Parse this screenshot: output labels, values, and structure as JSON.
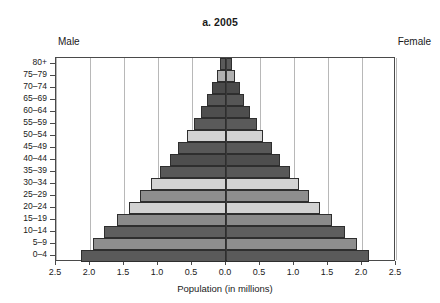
{
  "chart": {
    "title": "a. 2005",
    "left_label": "Male",
    "right_label": "Female",
    "xlabel": "Population (in millions)"
  },
  "chart_data": {
    "type": "bar",
    "subtype": "population-pyramid",
    "title": "a. 2005",
    "xlabel": "Population (in millions)",
    "ylabel": "",
    "xlim": [
      -2.5,
      2.5
    ],
    "xticks": [
      "2.5",
      "2.0",
      "1.5",
      "1.0",
      "0.5",
      "0.0",
      "0.5",
      "1.0",
      "1.5",
      "2.0",
      "2.5"
    ],
    "xtick_values": [
      -2.5,
      -2.0,
      -1.5,
      -1.0,
      -0.5,
      0.0,
      0.5,
      1.0,
      1.5,
      2.0,
      2.5
    ],
    "grid": true,
    "legend": false,
    "categories": [
      "80+",
      "75–79",
      "70–74",
      "65–69",
      "60–64",
      "55–59",
      "50–54",
      "45–49",
      "40–44",
      "35–39",
      "30–34",
      "25–29",
      "20–24",
      "15–19",
      "10–14",
      "5–9",
      "0–4"
    ],
    "series": [
      {
        "name": "Male",
        "side": "left",
        "values": [
          0.09,
          0.13,
          0.2,
          0.28,
          0.37,
          0.47,
          0.57,
          0.7,
          0.83,
          0.97,
          1.1,
          1.26,
          1.43,
          1.6,
          1.8,
          1.96,
          2.13
        ]
      },
      {
        "name": "Female",
        "side": "right",
        "values": [
          0.09,
          0.13,
          0.2,
          0.27,
          0.36,
          0.45,
          0.55,
          0.67,
          0.8,
          0.94,
          1.07,
          1.22,
          1.38,
          1.56,
          1.75,
          1.92,
          2.1
        ]
      }
    ],
    "bar_colors": [
      "#5a5a5a",
      "#b0b0b0",
      "#4a4a4a",
      "#565656",
      "#4e4e4e",
      "#5a5a5a",
      "#d2d2d2",
      "#585858",
      "#4e4e4e",
      "#585858",
      "#d2d2d2",
      "#8e8e8e",
      "#d2d2d2",
      "#8a8a8a",
      "#5e5e5e",
      "#8e8e8e",
      "#5a5a5a"
    ],
    "colors": {
      "dark": "#4e4e4e",
      "medium": "#8e8e8e",
      "light": "#d2d2d2",
      "axis": "#3a3a3a",
      "grid": "#b8b8b8"
    }
  }
}
